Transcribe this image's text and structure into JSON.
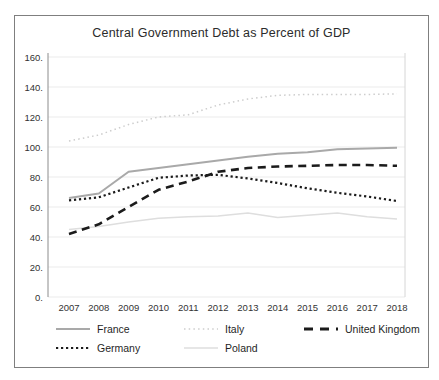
{
  "chart_data": {
    "type": "line",
    "title": "Central Government Debt as Percent of GDP",
    "xlabel": "",
    "ylabel": "",
    "x": [
      2007,
      2008,
      2009,
      2010,
      2011,
      2012,
      2013,
      2014,
      2015,
      2016,
      2017,
      2018
    ],
    "ylim": [
      0,
      160
    ],
    "ytick_step": 20,
    "ytick_suffix": ".",
    "grid": true,
    "legend_position": "bottom",
    "series": [
      {
        "name": "France",
        "color": "#a9a9a9",
        "dash": "",
        "width": 2,
        "values": [
          66,
          69,
          83.5,
          86,
          88.5,
          91,
          93.5,
          95.5,
          96.5,
          98.5,
          99,
          99.5
        ]
      },
      {
        "name": "Italy",
        "color": "#cdcdcd",
        "dash": "1.5 3.2",
        "width": 1.5,
        "values": [
          104,
          108,
          115,
          120,
          121.5,
          128,
          132,
          134.5,
          135,
          135,
          135,
          135.5
        ]
      },
      {
        "name": "United Kingdom",
        "color": "#1b1b1b",
        "dash": "8 5.5",
        "width": 2.6,
        "values": [
          42,
          48.5,
          60,
          71.5,
          77,
          83.5,
          86,
          87,
          87.5,
          88,
          88,
          87.5
        ]
      },
      {
        "name": "Germany",
        "color": "#1b1b1b",
        "dash": "2.2 2.8",
        "width": 2.2,
        "values": [
          64.5,
          66.5,
          73,
          79.5,
          81,
          81.5,
          79,
          76,
          72.5,
          69.5,
          67,
          64
        ]
      },
      {
        "name": "Poland",
        "color": "#dedede",
        "dash": "",
        "width": 1.5,
        "values": [
          45,
          47,
          50,
          52.5,
          53.5,
          54,
          56,
          53,
          54.5,
          56,
          53.5,
          52
        ]
      }
    ],
    "legend_rows": [
      [
        "France",
        "Italy",
        "United Kingdom"
      ],
      [
        "Germany",
        "Poland"
      ]
    ],
    "colors": {
      "gridline": "#ebebeb",
      "axis_left": "#8c8c8c",
      "plot_right_edge": "#d6d6d6",
      "tick_text": "#333333"
    }
  }
}
